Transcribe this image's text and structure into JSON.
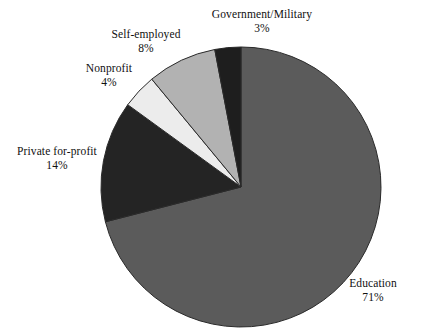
{
  "chart_data": {
    "type": "pie",
    "title": "",
    "subtitle": "",
    "xlabel": "",
    "ylabel": "",
    "legend_position": "none",
    "grid": false,
    "unit": "%",
    "total": 100,
    "start_angle_deg": 0,
    "direction": "clockwise",
    "categories": [
      "Education",
      "Private for-profit",
      "Nonprofit",
      "Self-employed",
      "Government/Military"
    ],
    "values": [
      71,
      14,
      4,
      8,
      3
    ],
    "slices": [
      {
        "label": "Education",
        "value": 71,
        "value_text": "71%",
        "color": "#5b5b5b",
        "start_deg": 0,
        "end_deg": 255.6
      },
      {
        "label": "Private for-profit",
        "value": 14,
        "value_text": "14%",
        "color": "#242424",
        "start_deg": 255.6,
        "end_deg": 306.0
      },
      {
        "label": "Nonprofit",
        "value": 4,
        "value_text": "4%",
        "color": "#ececec",
        "start_deg": 306.0,
        "end_deg": 320.4
      },
      {
        "label": "Self-employed",
        "value": 8,
        "value_text": "8%",
        "color": "#b2b2b2",
        "start_deg": 320.4,
        "end_deg": 349.2
      },
      {
        "label": "Government/Military",
        "value": 3,
        "value_text": "3%",
        "color": "#1e1e1e",
        "start_deg": 349.2,
        "end_deg": 360.0
      }
    ]
  },
  "labels": {
    "education": {
      "name": "Education",
      "value": "71%"
    },
    "private": {
      "name": "Private for-profit",
      "value": "14%"
    },
    "nonprofit": {
      "name": "Nonprofit",
      "value": "4%"
    },
    "selfemployed": {
      "name": "Self-employed",
      "value": "8%"
    },
    "government": {
      "name": "Government/Military",
      "value": "3%"
    }
  },
  "geometry": {
    "center_x": 241,
    "center_y": 187,
    "radius": 140
  },
  "colors": {
    "background": "#ffffff",
    "text": "#101010",
    "outline": "#2a2a2a"
  }
}
